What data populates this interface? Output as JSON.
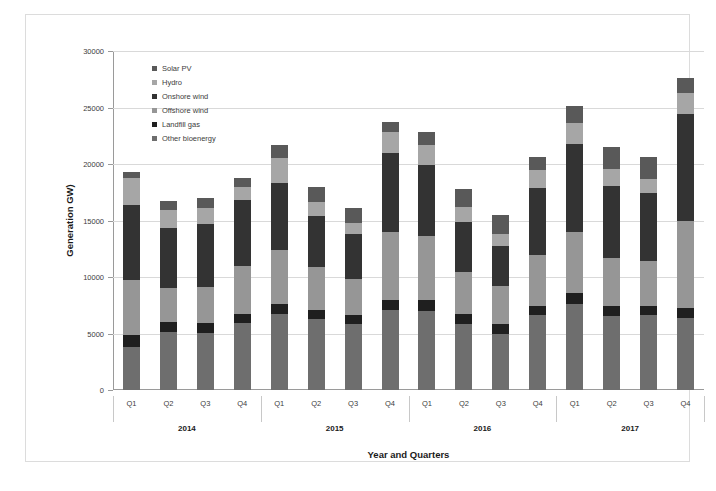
{
  "chart_data": {
    "type": "bar",
    "stacked": true,
    "title": "",
    "xlabel": "Year and Quarters",
    "ylabel": "Generation GW)",
    "ylim": [
      0,
      30000
    ],
    "yticks": [
      0,
      5000,
      10000,
      15000,
      20000,
      25000,
      30000
    ],
    "grid": true,
    "legend_position": "inside-top-left",
    "categories": [
      "Q1",
      "Q2",
      "Q3",
      "Q4",
      "Q1",
      "Q2",
      "Q3",
      "Q4",
      "Q1",
      "Q2",
      "Q3",
      "Q4",
      "Q1",
      "Q2",
      "Q3",
      "Q4"
    ],
    "group_labels": [
      "2014",
      "2015",
      "2016",
      "2017"
    ],
    "group_size": 4,
    "stack_order_bottom_to_top": [
      "Other bioenergy",
      "Landfill gas",
      "Offshore wind",
      "Onshore wind",
      "Hydro",
      "Solar PV"
    ],
    "series": [
      {
        "name": "Solar PV",
        "color": "#595959",
        "values": [
          500,
          750,
          900,
          800,
          1100,
          1300,
          1350,
          900,
          1150,
          1550,
          1700,
          1150,
          1450,
          1900,
          1950,
          1350
        ]
      },
      {
        "name": "Hydro",
        "color": "#a6a6a6",
        "values": [
          2450,
          1650,
          1400,
          1100,
          2250,
          1250,
          1000,
          1800,
          1750,
          1350,
          1050,
          1650,
          1900,
          1500,
          1200,
          1800
        ]
      },
      {
        "name": "Onshore wind",
        "color": "#333333",
        "values": [
          6650,
          5250,
          5550,
          5900,
          5950,
          4550,
          3950,
          7000,
          6300,
          4400,
          3550,
          5900,
          7750,
          6400,
          6000,
          9450
        ]
      },
      {
        "name": "Offshore wind",
        "color": "#969696",
        "values": [
          4800,
          3050,
          3250,
          4250,
          4700,
          3750,
          3200,
          6000,
          5600,
          3750,
          3350,
          4500,
          5400,
          4250,
          4000,
          7700
        ]
      },
      {
        "name": "Landfill gas",
        "color": "#1f1f1f",
        "values": [
          1050,
          900,
          850,
          800,
          900,
          850,
          850,
          900,
          1000,
          900,
          850,
          850,
          1000,
          900,
          850,
          900
        ]
      },
      {
        "name": "Other bioenergy",
        "color": "#6e6e6e",
        "values": [
          3850,
          5100,
          5050,
          5900,
          6750,
          6250,
          5800,
          7100,
          7000,
          5800,
          5000,
          6600,
          7600,
          6550,
          6600,
          6400
        ]
      }
    ],
    "totals": [
      19300,
      16700,
      17000,
      18750,
      21650,
      17950,
      16150,
      23700,
      22800,
      17750,
      15500,
      20650,
      25100,
      21500,
      20600,
      27600
    ]
  }
}
